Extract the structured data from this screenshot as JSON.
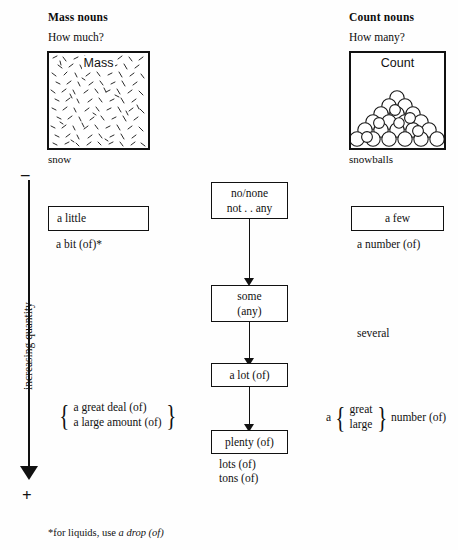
{
  "columns": {
    "mass": {
      "heading": "Mass nouns",
      "question": "How much?",
      "picture_label": "Mass",
      "caption": "snow"
    },
    "count": {
      "heading": "Count nouns",
      "question": "How many?",
      "picture_label": "Count",
      "caption": "snowballs"
    }
  },
  "axis": {
    "minus": "–",
    "plus": "+",
    "label": "increasing quantity"
  },
  "center_chain": [
    {
      "line1": "no/none",
      "line2": "not . . any"
    },
    {
      "line1": "some",
      "line2": "(any)"
    },
    {
      "line1": "a lot (of)",
      "line2": ""
    },
    {
      "line1": "plenty (of)",
      "line2": ""
    }
  ],
  "center_extras": {
    "lots": "lots (of)",
    "tons": "tons (of)"
  },
  "mass_column": {
    "box1": "a little",
    "under_box1": "a bit (of)*",
    "brace_items": [
      "a great deal (of)",
      "a large amount (of)"
    ]
  },
  "count_column": {
    "box1": "a few",
    "under_box1": "a number (of)",
    "several": "several",
    "brace_prefix": "a",
    "brace_items": [
      "great",
      "large"
    ],
    "brace_suffix": "number (of)"
  },
  "footnote": {
    "marker": "*",
    "text": "for liquids, use ",
    "italic": "a drop (of)"
  }
}
